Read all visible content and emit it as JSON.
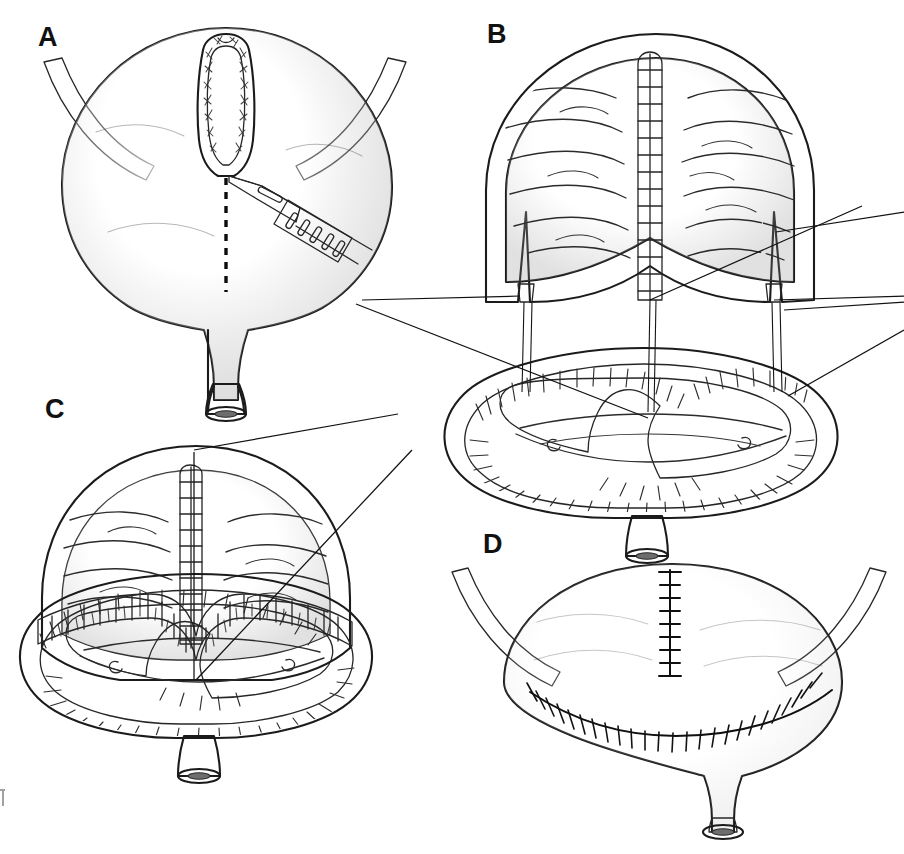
{
  "figure": {
    "background_color": "#ffffff",
    "ink_color": "#141414",
    "style": "grayscale medical line illustration with diagonal hatch shading"
  },
  "palette": {
    "paper": "#ffffff",
    "serosa_light": "#d9d9d9",
    "serosa_mid": "#c2c2c2",
    "wall_grey": "#b4b4b4",
    "mucosa_light": "#e3e3e3",
    "mucosa_pale": "#efefef",
    "lumen_shadow": "#a9a9a9",
    "trigone_dark": "#9e9e9e",
    "ligament_grey": "#9b9b9b",
    "ligament_edge": "#6f6f6f",
    "cut_rim": "#b8b8b8",
    "blade_steel": "#cfcfcf",
    "outline": "#1b1b1b"
  },
  "panels": [
    {
      "id": "A",
      "label": "A",
      "label_x": 38,
      "label_y": 46,
      "caption": "Intact bladder with dome opened; midline incision marked and carried down with scalpel",
      "elements": {
        "organ": "bladder",
        "dome_opening": "urachal / dome cystotomy with cut muscular rim",
        "incision_guide": "dashed midline incision line",
        "instrument": "scalpel with knurled handle and slotted blade",
        "lateral_bands": "obliterated umbilical ligaments (left and right)",
        "outlet": "urethral stump with elliptical lumen"
      }
    },
    {
      "id": "B",
      "label": "B",
      "label_x": 487,
      "label_y": 43,
      "caption": "Bladder bivalved: upper dome flap reflected above, trigonal bowl below, correspondence lines matching edges",
      "elements": {
        "upper_flap": "reflected dome flap showing mucosal rugae",
        "running_suture": "ladder-style running closure on flap midline",
        "lower_bowl": "opened trigonal half with detrusor villi and interureteric ridge",
        "ureteral_orifices": "two ureteral orifices on trigone",
        "correspondence_lines": "vertical alignment lines from flap corners to bowl rim",
        "leader_lines": "annotation leaders to left and right margins"
      }
    },
    {
      "id": "C",
      "label": "C",
      "label_x": 45,
      "label_y": 418,
      "caption": "Dome flap approximated to trigonal rim with interrupted suture row",
      "elements": {
        "flap": "dome flap brought down over trigone",
        "anastomosis": "scalloped interrupted suture row along wavy junction",
        "running_suture": "ladder-style midline closure continuing into junction",
        "leader_lines": "two annotation leaders toward upper right"
      }
    },
    {
      "id": "D",
      "label": "D",
      "label_x": 483,
      "label_y": 553,
      "caption": "Completed reconstruction with vertical and transverse suture lines",
      "elements": {
        "vertical_suture_line": "midline vertical closure, 9 cross stitches",
        "transverse_suture_line": "curved transverse closure, ~25 cross stitches",
        "lateral_bands": "obliterated umbilical ligaments (left and right)",
        "outlet": "urethral stump with elliptical lumen"
      }
    }
  ],
  "counts": {
    "panel_a_blade_grip_ovals": 5,
    "panel_b_ladder_rungs": 14,
    "panel_c_ladder_rungs": 11,
    "panel_c_suture_segments": 21,
    "panel_d_vertical_stitches": 9,
    "panel_d_transverse_stitches": 25,
    "ureteral_orifices": 2
  },
  "margin_mark": {
    "present": true,
    "description": "partial cropped glyph at left page edge",
    "text": ""
  }
}
